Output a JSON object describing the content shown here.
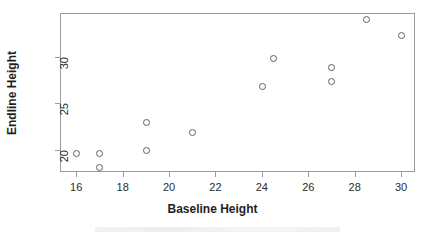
{
  "chart_data": {
    "type": "scatter",
    "title": "",
    "xlabel": "Baseline Height",
    "ylabel": "Endline Height",
    "xlim": [
      15.3,
      30.6
    ],
    "ylim": [
      17.6,
      34.7
    ],
    "grid": false,
    "legend": null,
    "marker": "open-circle",
    "marker_color": "#5f5f5f",
    "xticks": [
      16,
      18,
      20,
      22,
      24,
      26,
      28,
      30
    ],
    "xticklabels": [
      "16",
      "18",
      "20",
      "22",
      "24",
      "26",
      "28",
      "30"
    ],
    "yticks": [
      20,
      25,
      30
    ],
    "yticklabels": [
      "20",
      "25",
      "30"
    ],
    "points": [
      {
        "x": 16.0,
        "y": 19.6
      },
      {
        "x": 17.0,
        "y": 19.6
      },
      {
        "x": 17.0,
        "y": 18.1
      },
      {
        "x": 19.0,
        "y": 23.0
      },
      {
        "x": 19.0,
        "y": 20.0
      },
      {
        "x": 21.0,
        "y": 21.9
      },
      {
        "x": 24.0,
        "y": 26.9
      },
      {
        "x": 24.5,
        "y": 29.9
      },
      {
        "x": 27.0,
        "y": 28.9
      },
      {
        "x": 27.0,
        "y": 27.4
      },
      {
        "x": 28.5,
        "y": 34.1
      },
      {
        "x": 30.0,
        "y": 32.3
      }
    ]
  },
  "axes": {
    "frame_color": "#9a9a9a",
    "tick_color": "#9a9a9a",
    "text_color": "#2b2b2b",
    "label_color": "#1f1f1f"
  },
  "background": "#ffffff"
}
